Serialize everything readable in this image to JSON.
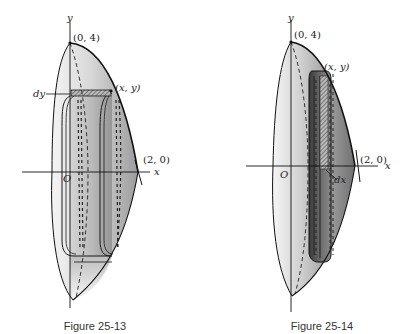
{
  "figures": [
    {
      "id": "fig-25-13",
      "caption": "Figure 25-13",
      "labels": {
        "y_axis": "y",
        "x_axis": "x",
        "origin": "O",
        "apex": "(0, 4)",
        "point": "(x, y)",
        "intercept": "(2, 0)",
        "differential": "dy"
      },
      "method": "disk/washer slice of thickness dy"
    },
    {
      "id": "fig-25-14",
      "caption": "Figure 25-14",
      "labels": {
        "y_axis": "y",
        "x_axis": "x",
        "origin": "O",
        "apex": "(0, 4)",
        "point": "(x, y)",
        "intercept": "(2, 0)",
        "differential": "dx"
      },
      "method": "cylindrical shell of thickness dx"
    }
  ],
  "colors": {
    "stroke": "#1a1a1a",
    "shade_dark": "#5a5a5a",
    "shade_mid": "#a8a8a8",
    "shade_light": "#eeeeee"
  }
}
